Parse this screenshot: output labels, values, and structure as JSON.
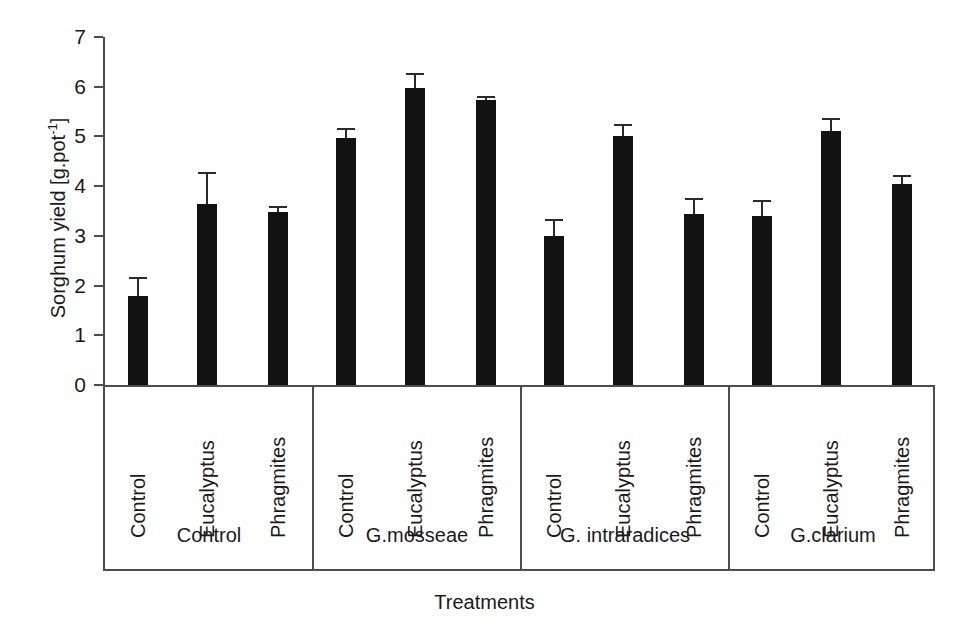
{
  "chart_data": {
    "type": "bar",
    "title": "",
    "xlabel": "Treatments",
    "ylabel": "Sorghum yield [g.pot",
    "ylabel_sup": "-1",
    "ylabel_suffix": "]",
    "ylim": [
      0,
      7
    ],
    "ytick_labels": [
      "0",
      "1",
      "2",
      "3",
      "4",
      "5",
      "6",
      "7"
    ],
    "ytick_values": [
      0,
      1,
      2,
      3,
      4,
      5,
      6,
      7
    ],
    "grid": false,
    "legend": "none",
    "bar_color": "#121212",
    "axis_color": "#4d4d4d",
    "categories": [
      "Control",
      "Eucalyptus",
      "Phragmites"
    ],
    "groups": [
      {
        "label": "Control",
        "bars": [
          {
            "category": "Control",
            "value": 1.8,
            "error": 0.38
          },
          {
            "category": "Eucalyptus",
            "value": 3.65,
            "error": 0.63
          },
          {
            "category": "Phragmites",
            "value": 3.48,
            "error": 0.12
          }
        ]
      },
      {
        "label": "G.mosseae",
        "bars": [
          {
            "category": "Control",
            "value": 4.97,
            "error": 0.2
          },
          {
            "category": "Eucalyptus",
            "value": 5.98,
            "error": 0.3
          },
          {
            "category": "Phragmites",
            "value": 5.74,
            "error": 0.08
          }
        ]
      },
      {
        "label": "G. intraradices",
        "bars": [
          {
            "category": "Control",
            "value": 3.0,
            "error": 0.33
          },
          {
            "category": "Eucalyptus",
            "value": 5.0,
            "error": 0.25
          },
          {
            "category": "Phragmites",
            "value": 3.44,
            "error": 0.33
          }
        ]
      },
      {
        "label": "G.clarium",
        "bars": [
          {
            "category": "Control",
            "value": 3.4,
            "error": 0.33
          },
          {
            "category": "Eucalyptus",
            "value": 5.1,
            "error": 0.28
          },
          {
            "category": "Phragmites",
            "value": 4.05,
            "error": 0.17
          }
        ]
      }
    ]
  }
}
